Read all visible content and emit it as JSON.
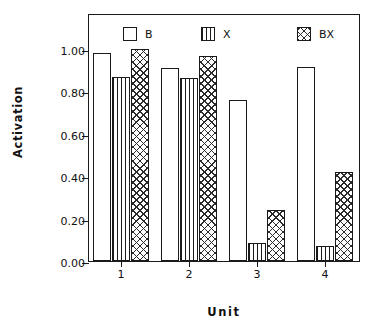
{
  "chart_data": {
    "type": "bar",
    "title": "",
    "xlabel": "Unit",
    "ylabel": "Activation",
    "categories": [
      "1",
      "2",
      "3",
      "4"
    ],
    "series": [
      {
        "name": "B",
        "pattern": "empty",
        "values": [
          0.98,
          0.91,
          0.76,
          0.915
        ]
      },
      {
        "name": "X",
        "pattern": "vlines",
        "values": [
          0.87,
          0.865,
          0.085,
          0.07
        ]
      },
      {
        "name": "BX",
        "pattern": "crosshatch",
        "values": [
          1.0,
          0.965,
          0.24,
          0.42
        ]
      }
    ],
    "ylim": [
      0.0,
      1.0
    ],
    "yticks": [
      0.0,
      0.2,
      0.4,
      0.6,
      0.8,
      1.0
    ],
    "ytick_labels": [
      "0.00",
      "0.20",
      "0.40",
      "0.60",
      "0.80",
      "1.00"
    ],
    "xtick_labels": [
      "1",
      "2",
      "3",
      "4"
    ],
    "grid": false,
    "legend_position": "top-inside",
    "legend_entries": [
      {
        "label": "B",
        "pattern": "empty"
      },
      {
        "label": "X",
        "pattern": "vlines"
      },
      {
        "label": "BX",
        "pattern": "crosshatch"
      }
    ],
    "colors": {
      "axis": "#1a1a1a",
      "bar_edge": "#1a1a1a",
      "bar_fill": "#ffffff",
      "hatch": "#2a2a2a",
      "background": "#ffffff"
    }
  }
}
